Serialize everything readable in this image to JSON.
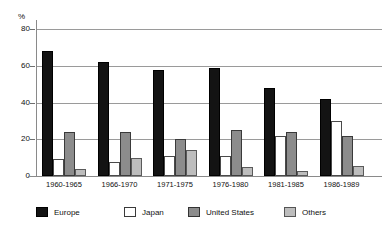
{
  "chart_data": {
    "type": "bar",
    "title": "",
    "subtitle": "",
    "xlabel": "",
    "ylabel": "%",
    "ylim": [
      0,
      85
    ],
    "yticks": [
      0,
      20,
      40,
      60,
      80
    ],
    "ytick_labels": [
      "0",
      "20",
      "40",
      "60",
      "80"
    ],
    "grid": true,
    "legend_position": "bottom",
    "categories": [
      "1960-1965",
      "1966-1970",
      "1971-1975",
      "1976-1980",
      "1981-1985",
      "1986-1989"
    ],
    "series": [
      {
        "name": "Europe",
        "color": "#131313",
        "values": [
          68,
          62,
          58,
          59,
          48,
          42
        ]
      },
      {
        "name": "Japan",
        "color": "#ffffff",
        "values": [
          9,
          7.5,
          11,
          11,
          22,
          30
        ]
      },
      {
        "name": "United States",
        "color": "#8c8c8c",
        "values": [
          24,
          24,
          20,
          25,
          24,
          22
        ]
      },
      {
        "name": "Others",
        "color": "#bdbdbd",
        "values": [
          4,
          10,
          14,
          5,
          3,
          5.5
        ]
      }
    ]
  },
  "axis": {
    "percent_symbol": "%"
  },
  "legend": {
    "items": [
      {
        "label": "Europe",
        "key": "europe"
      },
      {
        "label": "Japan",
        "key": "japan"
      },
      {
        "label": "United States",
        "key": "us"
      },
      {
        "label": "Others",
        "key": "others"
      }
    ]
  }
}
